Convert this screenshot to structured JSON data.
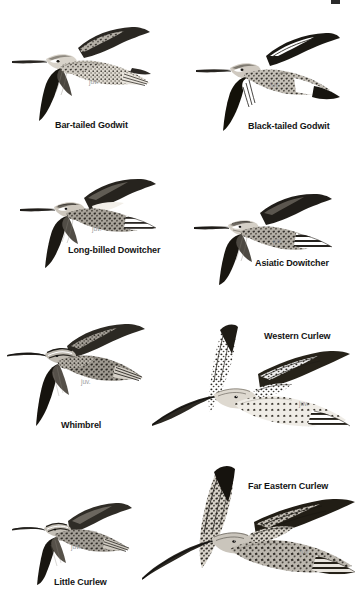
{
  "plate": {
    "background_color": "#ffffff",
    "label_color": "#141414",
    "juv_color": "#9a9a9a",
    "width": 360,
    "height": 602
  },
  "figures": [
    {
      "id": "bar-tailed-godwit",
      "label": "Bar-tailed Godwit",
      "juv": "juv.",
      "label_x": 55,
      "label_y": 120,
      "juv_x": 89,
      "juv_y": 78,
      "art_x": 4,
      "art_y": 18,
      "art_w": 148,
      "art_h": 105
    },
    {
      "id": "black-tailed-godwit",
      "label": "Black-tailed Godwit",
      "juv": "juv.",
      "label_x": 248,
      "label_y": 121,
      "juv_x": 270,
      "juv_y": 81,
      "art_x": 190,
      "art_y": 22,
      "art_w": 150,
      "art_h": 110
    },
    {
      "id": "long-billed-dowitcher",
      "label": "Long-billed Dowitcher",
      "juv": "juv.",
      "label_x": 68,
      "label_y": 245,
      "juv_x": 92,
      "juv_y": 225,
      "art_x": 18,
      "art_y": 172,
      "art_w": 140,
      "art_h": 96
    },
    {
      "id": "asiatic-dowitcher",
      "label": "Asiatic Dowitcher",
      "juv": "juv.",
      "label_x": 255,
      "label_y": 258,
      "juv_x": 273,
      "juv_y": 237,
      "art_x": 192,
      "art_y": 185,
      "art_w": 142,
      "art_h": 100
    },
    {
      "id": "whimbrel",
      "label": "Whimbrel",
      "juv": "juv.",
      "label_x": 61,
      "label_y": 420,
      "juv_x": 81,
      "juv_y": 378,
      "art_x": 5,
      "art_y": 318,
      "art_w": 140,
      "art_h": 108
    },
    {
      "id": "western-curlew",
      "label": "Western Curlew",
      "juv": "juv.",
      "label_x": 264,
      "label_y": 331,
      "juv_x": 299,
      "juv_y": 400,
      "art_x": 150,
      "art_y": 318,
      "art_w": 200,
      "art_h": 122
    },
    {
      "id": "little-curlew",
      "label": "Little Curlew",
      "juv": "juv.",
      "label_x": 54,
      "label_y": 577,
      "juv_x": 71,
      "juv_y": 543,
      "art_x": 10,
      "art_y": 497,
      "art_w": 122,
      "art_h": 88
    },
    {
      "id": "far-eastern-curlew",
      "label": "Far Eastern Curlew",
      "juv": "juv.",
      "label_x": 248,
      "label_y": 481,
      "juv_x": 300,
      "juv_y": 548,
      "art_x": 140,
      "art_y": 462,
      "art_w": 215,
      "art_h": 130
    }
  ],
  "corner_mark": {
    "x": 331,
    "y": 0,
    "width": 9,
    "height": 4
  }
}
